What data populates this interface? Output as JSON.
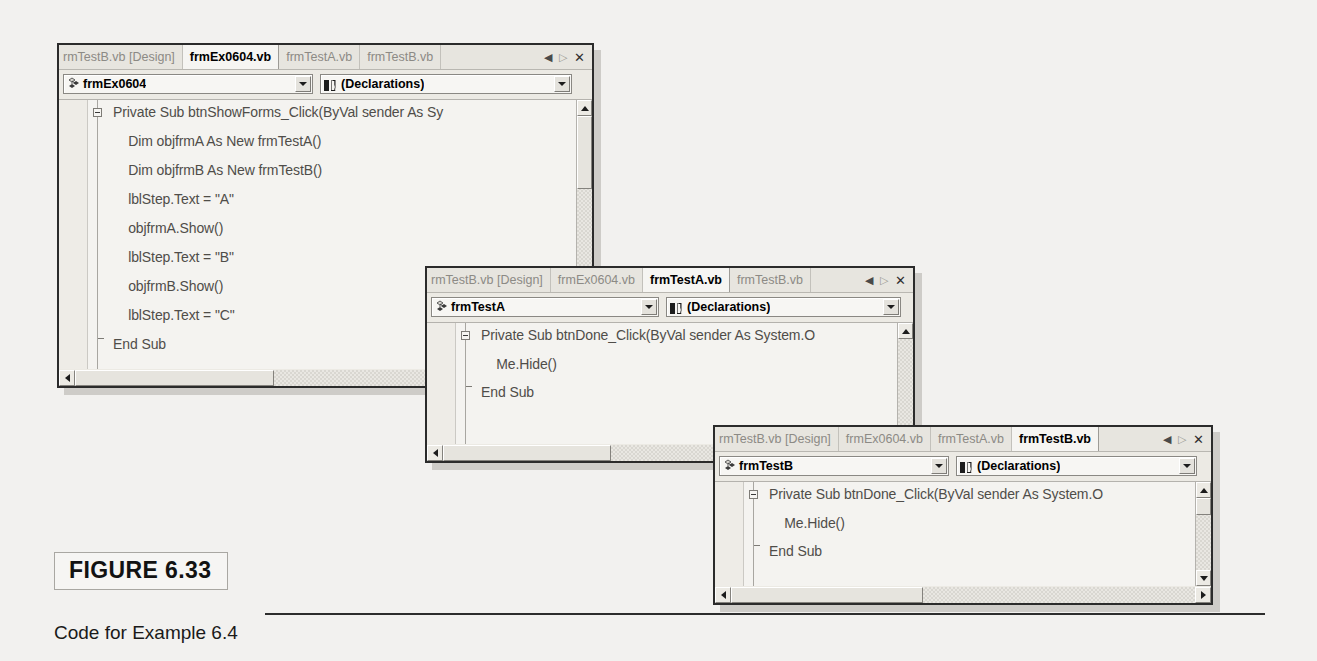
{
  "figure": {
    "badge_label": "FIGURE 6.33",
    "caption": "Code for Example 6.4"
  },
  "windows": [
    {
      "id": "window-frmex0604",
      "tabs": [
        {
          "label": "rmTestB.vb [Design]",
          "active": false
        },
        {
          "label": "frmEx0604.vb",
          "active": true
        },
        {
          "label": "frmTestA.vb",
          "active": false
        },
        {
          "label": "frmTestB.vb",
          "active": false
        }
      ],
      "tab_nav": {
        "prev": "◀",
        "next": "▷",
        "close": "✕"
      },
      "class_combo": {
        "value": "frmEx0604",
        "icon": "object-class-icon"
      },
      "member_combo": {
        "value": "(Declarations)",
        "icon": "declarations-book-icon"
      },
      "code_lines": [
        "Private Sub btnShowForms_Click(ByVal sender As Sy",
        "    Dim objfrmA As New frmTestA()",
        "    Dim objfrmB As New frmTestB()",
        "    lblStep.Text = \"A\"",
        "    objfrmA.Show()",
        "    lblStep.Text = \"B\"",
        "    objfrmB.Show()",
        "    lblStep.Text = \"C\"",
        "End Sub"
      ]
    },
    {
      "id": "window-frmtesta",
      "tabs": [
        {
          "label": "rmTestB.vb [Design]",
          "active": false
        },
        {
          "label": "frmEx0604.vb",
          "active": false
        },
        {
          "label": "frmTestA.vb",
          "active": true
        },
        {
          "label": "frmTestB.vb",
          "active": false
        }
      ],
      "tab_nav": {
        "prev": "◀",
        "next": "▷",
        "close": "✕"
      },
      "class_combo": {
        "value": "frmTestA",
        "icon": "object-class-icon"
      },
      "member_combo": {
        "value": "(Declarations)",
        "icon": "declarations-book-icon"
      },
      "code_lines": [
        "Private Sub btnDone_Click(ByVal sender As System.O",
        "    Me.Hide()",
        "End Sub"
      ]
    },
    {
      "id": "window-frmtestb",
      "tabs": [
        {
          "label": "rmTestB.vb [Design]",
          "active": false
        },
        {
          "label": "frmEx0604.vb",
          "active": false
        },
        {
          "label": "frmTestA.vb",
          "active": false
        },
        {
          "label": "frmTestB.vb",
          "active": true
        }
      ],
      "tab_nav": {
        "prev": "◀",
        "next": "▷",
        "close": "✕"
      },
      "class_combo": {
        "value": "frmTestB",
        "icon": "object-class-icon"
      },
      "member_combo": {
        "value": "(Declarations)",
        "icon": "declarations-book-icon"
      },
      "code_lines": [
        "Private Sub btnDone_Click(ByVal sender As System.O",
        "    Me.Hide()",
        "End Sub"
      ]
    }
  ],
  "colors": {
    "window_border": "#2b2b2b",
    "tab_inactive_text": "#8c8a85",
    "tab_active_text": "#000000",
    "code_text": "#4f4d49",
    "chrome": "#eceae4",
    "code_bg": "#f4f3f0",
    "page_bg": "#f2f1ef"
  }
}
